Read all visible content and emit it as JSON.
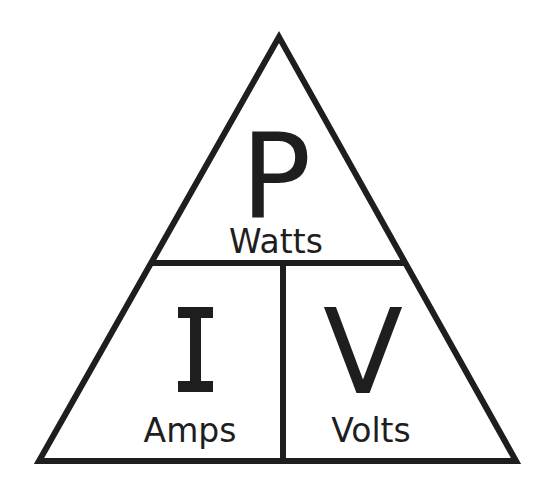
{
  "diagram": {
    "colors": {
      "background": "#ffffff",
      "ink": "#1e1e1e"
    },
    "sections": [
      {
        "id": "power",
        "symbol": "P",
        "unit": "Watts",
        "position": "top"
      },
      {
        "id": "current",
        "symbol": "I",
        "unit": "Amps",
        "position": "bottom-left"
      },
      {
        "id": "voltage",
        "symbol": "V",
        "unit": "Volts",
        "position": "bottom-right"
      }
    ]
  }
}
